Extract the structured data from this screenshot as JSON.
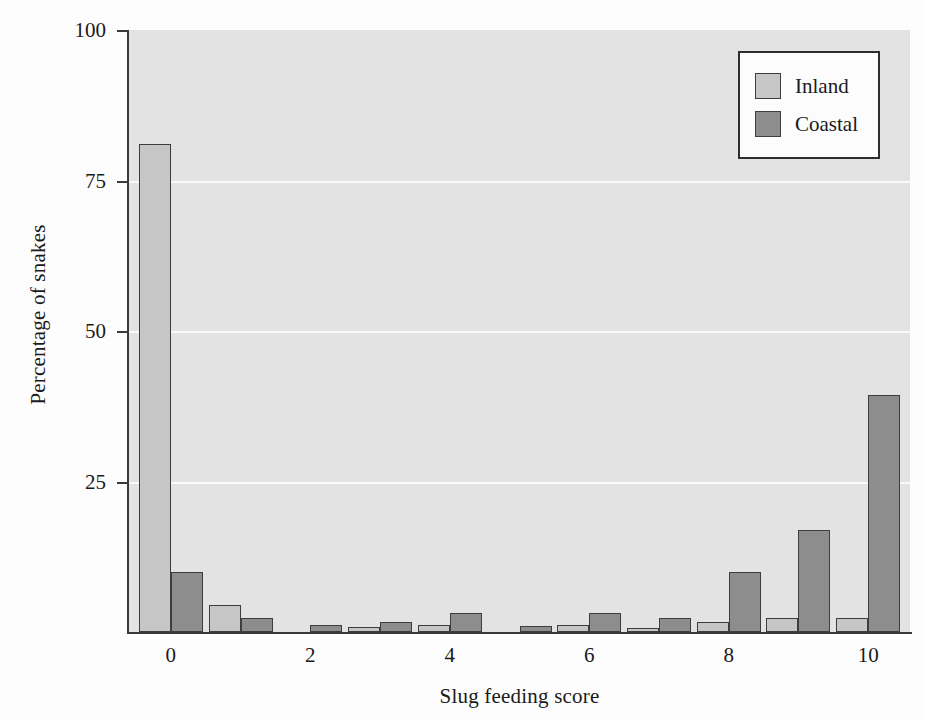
{
  "chart_data": {
    "type": "bar",
    "title": "",
    "xlabel": "Slug feeding score",
    "ylabel": "Percentage of snakes",
    "categories": [
      0,
      1,
      2,
      3,
      4,
      5,
      6,
      7,
      8,
      9,
      10
    ],
    "xlim": [
      -0.6,
      10.6
    ],
    "ylim": [
      0,
      100
    ],
    "xticks": [
      0,
      2,
      4,
      6,
      8,
      10
    ],
    "xticklabels": [
      "0",
      "2",
      "4",
      "6",
      "8",
      "10"
    ],
    "yticks": [
      0,
      25,
      50,
      75,
      100
    ],
    "yticklabels": [
      "0",
      "25",
      "50",
      "75",
      "100"
    ],
    "visible_yticklabels": [
      "100",
      "75",
      "50",
      "25"
    ],
    "grid": "horizontal-white-gridlines-at-25-50-75",
    "legend_position": "top-right",
    "series": [
      {
        "name": "Inland",
        "color": "#c6c6c6",
        "values": [
          81,
          4.5,
          0,
          0.8,
          1.2,
          0,
          1.2,
          0.7,
          1.7,
          2.3,
          2.3
        ]
      },
      {
        "name": "Coastal",
        "color": "#8d8d8d",
        "values": [
          10,
          2.3,
          1.2,
          1.7,
          3.2,
          1.0,
          3.2,
          2.3,
          10,
          17,
          39.4
        ]
      }
    ]
  },
  "axes": {
    "y_title": "Percentage of snakes",
    "x_title": "Slug feeding score",
    "y_ticks": [
      {
        "label": "100",
        "value": 100
      },
      {
        "label": "75",
        "value": 75
      },
      {
        "label": "50",
        "value": 50
      },
      {
        "label": "25",
        "value": 25
      }
    ],
    "x_ticks": [
      {
        "label": "0",
        "value": 0
      },
      {
        "label": "2",
        "value": 2
      },
      {
        "label": "4",
        "value": 4
      },
      {
        "label": "6",
        "value": 6
      },
      {
        "label": "8",
        "value": 8
      },
      {
        "label": "10",
        "value": 10
      }
    ]
  },
  "legend": {
    "entries": [
      {
        "label": "Inland",
        "color": "#c6c6c6"
      },
      {
        "label": "Coastal",
        "color": "#8d8d8d"
      }
    ]
  },
  "colors": {
    "plot_background": "#e3e3e3",
    "gridline": "#fafafa",
    "axis": "#3a3a3a",
    "bar_border": "#3d3d3d",
    "inland": "#c6c6c6",
    "coastal": "#8d8d8d"
  }
}
